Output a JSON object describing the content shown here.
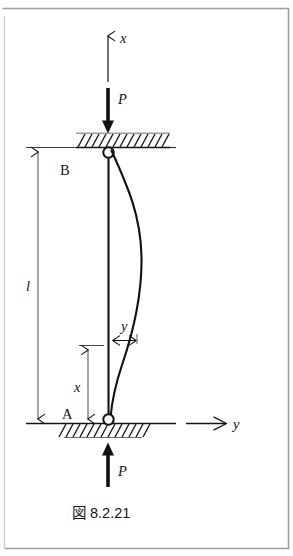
{
  "figure": {
    "caption": "図 8.2.21",
    "caption_prefix": "図",
    "caption_number": "8.2.21",
    "kind": "engineering-diagram",
    "background_color": "#ffffff",
    "ink_color": "#141414",
    "border_color": "#9a9a9a"
  },
  "labels": {
    "axis_x": "x",
    "axis_y": "y",
    "load_top": "P",
    "load_bottom": "P",
    "support_top": "B",
    "support_bottom": "A",
    "length": "l",
    "coordinate_x": "x",
    "deflection_y": "y"
  },
  "annotations": {
    "x_axis_arrow_direction": "up",
    "y_axis_arrow_direction": "right",
    "top_load_direction": "down",
    "bottom_load_direction": "up",
    "length_dimension": "double-headed",
    "x_dimension": "double-headed",
    "y_dimension": "double-headed",
    "top_hatching_side": "above",
    "bottom_hatching_side": "below",
    "buckled_curve_bulge": "right"
  },
  "geometry": {
    "column_top_y": 148,
    "column_bottom_y": 423,
    "column_x": 108,
    "length_px": 275,
    "x_dimension_top_y": 345,
    "max_deflection_px": 32
  }
}
